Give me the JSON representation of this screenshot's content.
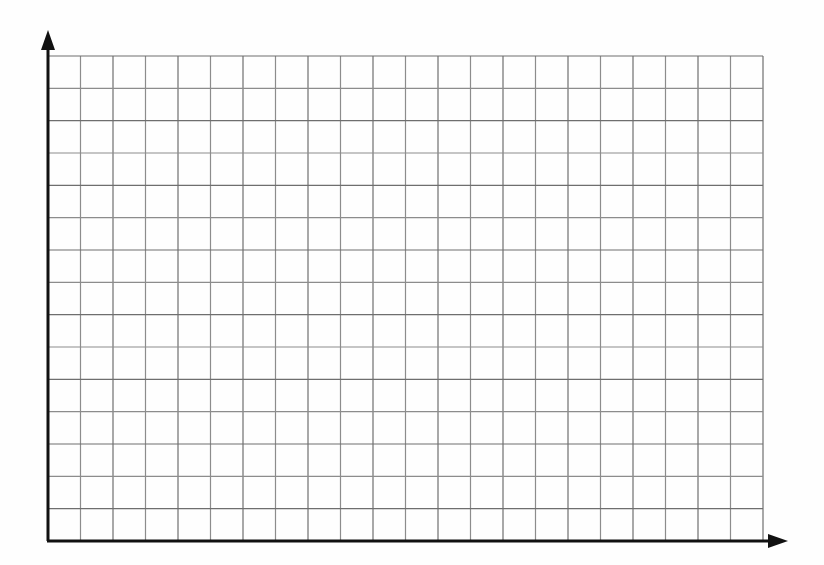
{
  "figure": {
    "title": "",
    "caption": "",
    "background_color": "#fefefe"
  },
  "chart_data": {
    "type": "scatter",
    "title": "",
    "subtitle": "",
    "xlabel": "",
    "ylabel": "",
    "x": [],
    "values": [],
    "series": [],
    "categories": [],
    "annotations": [],
    "legend": {
      "entries": [],
      "position": "none",
      "visible": false
    },
    "grid": {
      "visible": true,
      "columns": 22,
      "rows": 15,
      "cell_width_px": 32.5,
      "cell_height_px": 32.3,
      "line_color": "#8c8c8c",
      "line_width_px": 1.2
    },
    "axes": {
      "x": {
        "visible": true,
        "color": "#111111",
        "line_width_px": 3,
        "arrow": true,
        "tick_labels": [],
        "range_labeled": false
      },
      "y": {
        "visible": true,
        "color": "#111111",
        "line_width_px": 3,
        "arrow": true,
        "tick_labels": [],
        "range_labeled": false
      }
    },
    "data_labels": []
  },
  "geometry": {
    "origin_x_px": 48,
    "origin_y_px": 541,
    "grid_left_px": 48,
    "grid_right_px": 763,
    "grid_top_px": 56,
    "grid_bottom_px": 541,
    "y_axis_arrow_tip_y_px": 30,
    "x_axis_arrow_tip_x_px": 788
  },
  "colors": {
    "axis": "#111111",
    "grid_line": "#8c8c8c",
    "grid_line_strong": "#6e6e6e",
    "background": "#fefefe"
  },
  "icons": {
    "y_axis_arrow": "arrow-up-icon",
    "x_axis_arrow": "arrow-right-icon"
  }
}
